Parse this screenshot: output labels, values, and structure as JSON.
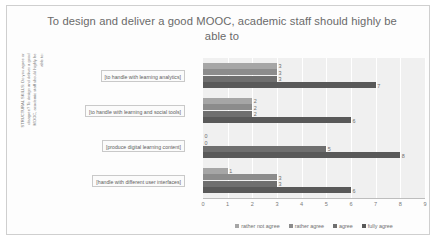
{
  "chart_data": {
    "type": "bar",
    "orientation": "horizontal",
    "title": "To design and deliver a good MOOC, academic staff should highly be able to",
    "xlabel": "",
    "ylabel": "STRUCTURAL SKILLS: Do you agree or\ndisagree? To design and deliver a good\nMOOC, academic staff should highly be\nable to:",
    "categories": [
      "[to handle with learning analytics]",
      "[to handle with learning and social tools]",
      "[produce digital learning content]",
      "[handle with different user interfaces]"
    ],
    "series": [
      {
        "name": "rather not agree",
        "color": "#a6a6a6",
        "values": [
          3,
          2,
          0,
          1
        ]
      },
      {
        "name": "rather agree",
        "color": "#8c8c8c",
        "values": [
          3,
          2,
          0,
          3
        ]
      },
      {
        "name": "agree",
        "color": "#6f6f6f",
        "values": [
          3,
          2,
          5,
          3
        ]
      },
      {
        "name": "fully agree",
        "color": "#595959",
        "values": [
          7,
          6,
          8,
          6
        ]
      }
    ],
    "xticks": [
      "0",
      "1",
      "2",
      "3",
      "4",
      "5",
      "6",
      "7",
      "8",
      "9"
    ],
    "xlim": [
      0,
      9
    ],
    "grid": true,
    "legend_position": "bottom",
    "plot_background": "#f0f0f0"
  }
}
